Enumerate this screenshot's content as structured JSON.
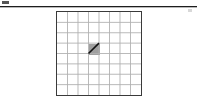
{
  "figure": {
    "caption": "",
    "background_color": "#ffffff"
  },
  "top_rule": {
    "line_color": "#1d1d1d",
    "shadow_color": "#b9b9b9",
    "left_tick_label": "",
    "right_tick_label": ""
  },
  "chart_data": {
    "type": "heatmap",
    "subtitle": "",
    "xlabel": "",
    "ylabel": "",
    "columns": 8,
    "rows": 8,
    "x": [
      1,
      2,
      3,
      4,
      5,
      6,
      7,
      8
    ],
    "y": [
      1,
      2,
      3,
      4,
      5,
      6,
      7,
      8
    ],
    "xticklabels": [
      "",
      "",
      "",
      "",
      "",
      "",
      "",
      ""
    ],
    "yticklabels": [
      "",
      "",
      "",
      "",
      "",
      "",
      "",
      ""
    ],
    "xlim": [
      0,
      8
    ],
    "ylim": [
      0,
      8
    ],
    "grid": true,
    "legend": "none",
    "grid_line_color": "#b0b0b0",
    "border_color": "#3a3a3a",
    "cell_fill_color": "#9f9f9f",
    "annotation_line_color": "#111111",
    "values": [
      [
        0,
        0,
        0,
        0,
        0,
        0,
        0,
        0
      ],
      [
        0,
        0,
        0,
        0,
        0,
        0,
        0,
        0
      ],
      [
        0,
        0,
        0,
        0,
        0,
        0,
        0,
        0
      ],
      [
        0,
        0,
        0,
        1,
        0,
        0,
        0,
        0
      ],
      [
        0,
        0,
        0,
        0,
        0,
        0,
        0,
        0
      ],
      [
        0,
        0,
        0,
        0,
        0,
        0,
        0,
        0
      ],
      [
        0,
        0,
        0,
        0,
        0,
        0,
        0,
        0
      ],
      [
        0,
        0,
        0,
        0,
        0,
        0,
        0,
        0
      ]
    ],
    "shaded_cells": [
      {
        "col": 4,
        "row": 4,
        "value": 1,
        "label": ""
      }
    ],
    "annotations": [
      {
        "type": "line",
        "label": "diagonal-segment",
        "x1": 3,
        "y1": 4,
        "x2": 4,
        "y2": 5,
        "color": "#111111",
        "width": 1.6
      }
    ]
  }
}
